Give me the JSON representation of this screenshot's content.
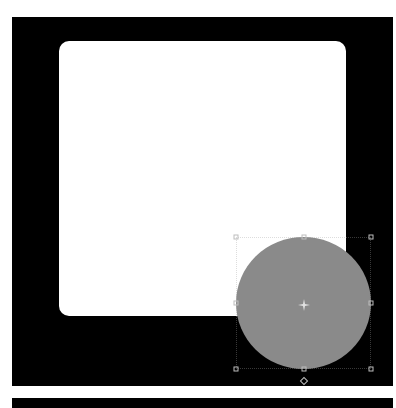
{
  "canvas": {
    "background": "#000000"
  },
  "shapes": [
    {
      "type": "rounded-rectangle",
      "fill": "#ffffff",
      "selected": false
    },
    {
      "type": "ellipse",
      "fill": "#8a8a8a",
      "selected": true
    }
  ],
  "selection": {
    "handles": [
      "top-left",
      "top-center",
      "top-right",
      "middle-left",
      "middle-right",
      "bottom-left",
      "bottom-center",
      "bottom-right"
    ],
    "rotate_handle": "bottom",
    "center_marker": "pivot-icon"
  }
}
